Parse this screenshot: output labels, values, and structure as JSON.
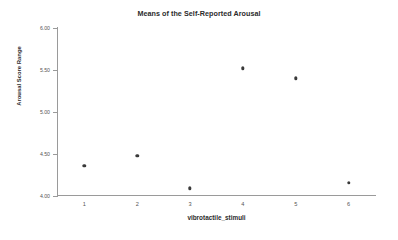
{
  "chart_data": {
    "type": "scatter",
    "title": "Means of the Self-Reported Arousal",
    "xlabel": "vibrotactile_stimuli",
    "ylabel": "Arousal Score Range",
    "categories": [
      "1",
      "2",
      "3",
      "4",
      "5",
      "6"
    ],
    "x": [
      1,
      2,
      3,
      4,
      5,
      6
    ],
    "values": [
      4.36,
      4.48,
      4.09,
      5.52,
      5.4,
      4.16
    ],
    "ylim": [
      4.0,
      6.0
    ],
    "xlim": [
      0.5,
      6.5
    ],
    "yticks": [
      "4.00",
      "4.50",
      "5.00",
      "5.50",
      "6.00"
    ],
    "ytick_values": [
      4.0,
      4.5,
      5.0,
      5.5,
      6.0
    ],
    "xticks": [
      "1",
      "2",
      "3",
      "4",
      "5",
      "6"
    ],
    "grid": false,
    "legend": false,
    "marker_color": "#3a3a3a",
    "axis_color": "#9a9a9a",
    "background": "#ffffff"
  }
}
